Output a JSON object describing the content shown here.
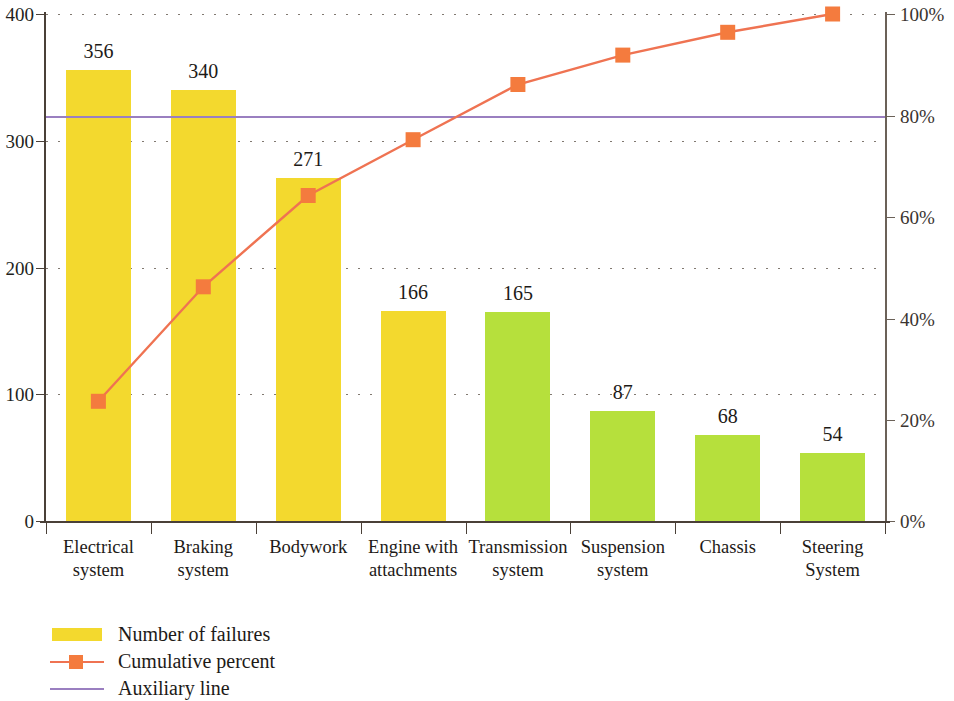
{
  "chart_data": {
    "type": "bar",
    "title": "",
    "subtitle": "",
    "xlabel": "",
    "ylabel": "",
    "y2label": "",
    "grid": true,
    "legend_position": "bottom-left",
    "categories": [
      "Electrical system",
      "Braking system",
      "Bodywork",
      "Engine with attachments",
      "Transmission system",
      "Suspension system",
      "Chassis",
      "Steering System"
    ],
    "category_lines": [
      [
        "Electrical",
        "system"
      ],
      [
        "Braking",
        "system"
      ],
      [
        "Bodywork",
        ""
      ],
      [
        "Engine with",
        "attachments"
      ],
      [
        "Transmission",
        "system"
      ],
      [
        "Suspension",
        "system"
      ],
      [
        "Chassis",
        ""
      ],
      [
        "Steering",
        "System"
      ]
    ],
    "series": [
      {
        "name": "Number of failures",
        "type": "bar",
        "axis": "left",
        "values": [
          356,
          340,
          271,
          166,
          165,
          87,
          68,
          54
        ],
        "value_labels": [
          "356",
          "340",
          "271",
          "166",
          "165",
          "87",
          "68",
          "54"
        ],
        "colors": [
          "#f3d92e",
          "#f3d92e",
          "#f3d92e",
          "#f3d92e",
          "#b6e03c",
          "#b6e03c",
          "#b6e03c",
          "#b6e03c"
        ]
      },
      {
        "name": "Cumulative percent",
        "type": "line",
        "axis": "right",
        "values": [
          23.6,
          46.2,
          64.2,
          75.2,
          86.1,
          91.9,
          96.4,
          100.0
        ],
        "color": "#ef7352",
        "marker_color": "#f47b3e",
        "marker": "square"
      },
      {
        "name": "Auxiliary line",
        "type": "line",
        "axis": "right",
        "constant_value": 80,
        "color": "#9a7fc0"
      }
    ],
    "ylim": [
      0,
      400
    ],
    "yticks": [
      0,
      100,
      200,
      300,
      400
    ],
    "ytick_labels": [
      "0",
      "100",
      "200",
      "300",
      "400"
    ],
    "y2lim": [
      0,
      100
    ],
    "y2ticks": [
      0,
      20,
      40,
      60,
      80,
      100
    ],
    "y2tick_labels": [
      "0%",
      "20%",
      "40%",
      "60%",
      "80%",
      "100%"
    ]
  },
  "legend": {
    "items": [
      {
        "label": "Number of failures",
        "swatch": "bar-swatch",
        "color": "#f3d92e"
      },
      {
        "label": "Cumulative percent",
        "swatch": "line-marker-swatch",
        "color": "#ef7352"
      },
      {
        "label": "Auxiliary line",
        "swatch": "line-swatch",
        "color": "#9a7fc0"
      }
    ]
  },
  "colors": {
    "bar_primary": "#f3d92e",
    "bar_secondary": "#b6e03c",
    "cumulative_line": "#ef7352",
    "cumulative_marker": "#f47b3e",
    "auxiliary_line": "#9a7fc0",
    "axis": "#4a4038",
    "grid": "#6b6158",
    "text": "#1d1a17"
  }
}
